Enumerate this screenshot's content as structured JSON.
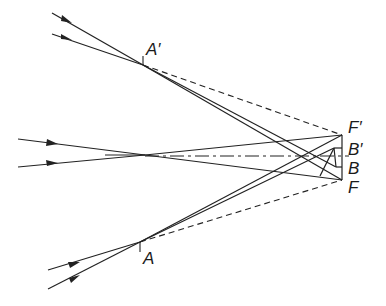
{
  "diagram": {
    "title": "",
    "labels": {
      "A_prime": "A′",
      "A": "A",
      "F_prime": "F′",
      "B_prime": "B′",
      "B": "B",
      "F": "F"
    },
    "points": {
      "A_prime": [
        143,
        65
      ],
      "A": [
        140,
        242
      ],
      "center": [
        145,
        155
      ],
      "F_prime": [
        342,
        135
      ],
      "B_prime": [
        342,
        148
      ],
      "B": [
        342,
        167
      ],
      "F": [
        342,
        180
      ]
    },
    "colors": {
      "line": "#222222",
      "background": "#ffffff"
    }
  }
}
